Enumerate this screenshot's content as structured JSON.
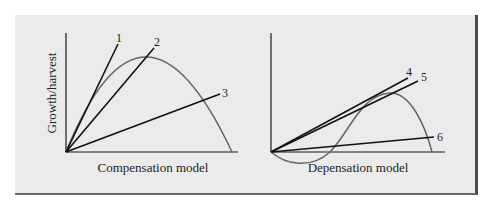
{
  "figure": {
    "background": "#ebebeb",
    "panels": [
      {
        "id": "compensation",
        "xlabel": "Compensation model",
        "ylabel": "Growth/harvest",
        "curve": "dome-shaped growth curve (compensatory)",
        "lines": [
          {
            "label": "1"
          },
          {
            "label": "2"
          },
          {
            "label": "3"
          }
        ]
      },
      {
        "id": "depensation",
        "xlabel": "Depensation model",
        "ylabel": "",
        "curve": "growth curve dipping below zero at low stock (depensatory)",
        "lines": [
          {
            "label": "4"
          },
          {
            "label": "5"
          },
          {
            "label": "6"
          }
        ]
      }
    ],
    "colors": {
      "axis": "#1a1a1a",
      "harvest_line": "#111111",
      "growth_curve": "#666666"
    }
  }
}
